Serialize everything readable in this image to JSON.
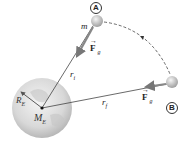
{
  "diagram": {
    "labels": {
      "point_a": "A",
      "point_b": "B",
      "mass": "m",
      "force_a": "F",
      "force_a_sub": "g",
      "force_b": "F",
      "force_b_sub": "g",
      "r_initial": "r",
      "r_initial_sub": "i",
      "r_final": "r",
      "r_final_sub": "f",
      "earth_radius": "R",
      "earth_radius_sub": "E",
      "earth_mass": "M",
      "earth_mass_sub": "E"
    },
    "colors": {
      "earth": "#d9d9d9",
      "ball": "#c8c8c8",
      "force_arrow": "#8a8a8a",
      "line": "#444444"
    }
  }
}
